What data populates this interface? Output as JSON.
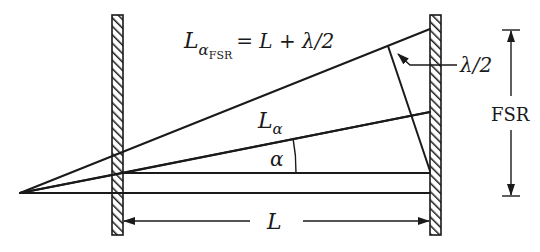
{
  "diagram": {
    "type": "optics-geometry",
    "colors": {
      "ink": "#1a1a1a",
      "background": "#ffffff"
    },
    "labels": {
      "top_ray_main": "L",
      "top_ray_subscript": "α",
      "top_ray_subsubscript": "FSR",
      "top_ray_equation": "= L + λ/2",
      "middle_ray_main": "L",
      "middle_ray_subscript": "α",
      "angle": "α",
      "half_wavelength": "λ/2",
      "fsr": "FSR",
      "spacing": "L"
    },
    "elements": {
      "mirrors": [
        "left-mirror",
        "right-mirror"
      ],
      "rays": [
        "axis-ray",
        "inner-ray",
        "alpha-ray",
        "fsr-ray"
      ],
      "dimensions": [
        "L-dimension-arrow",
        "FSR-dimension-arrow",
        "half-wavelength-leader"
      ]
    }
  }
}
